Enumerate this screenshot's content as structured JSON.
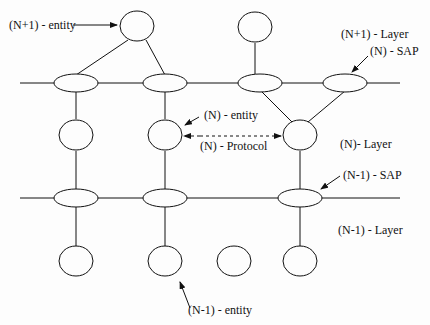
{
  "diagram": {
    "labels": {
      "n_plus_1_entity": "(N+1) - entity",
      "n_plus_1_layer": "(N+1) - Layer",
      "n_sap": "(N) - SAP",
      "n_entity": "(N) -  entity",
      "n_protocol": "(N) -  Protocol",
      "n_layer": "(N)- Layer",
      "n_minus_1_sap": "(N-1) - SAP",
      "n_minus_1_layer": "(N-1) - Layer",
      "n_minus_1_entity": "(N-1) -  entity"
    },
    "layers": [
      "(N+1) - Layer",
      "(N)- Layer",
      "(N-1) - Layer"
    ],
    "nodes": {
      "n_plus_1_entities": 2,
      "n_saps": 4,
      "n_entities": 3,
      "n_minus_1_saps": 3,
      "n_minus_1_entities": 4
    },
    "colors": {
      "stroke": "#111111",
      "background": "#ffffff"
    }
  }
}
